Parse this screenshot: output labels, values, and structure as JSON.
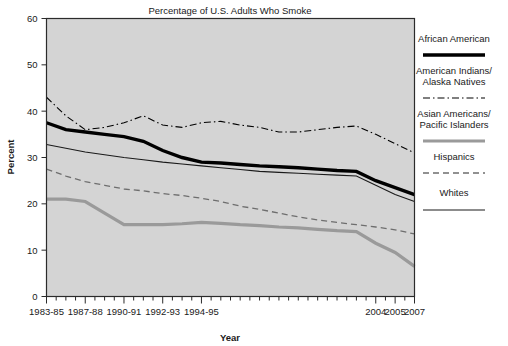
{
  "chart_data": {
    "type": "line",
    "title": "Percentage of U.S. Adults Who Smoke",
    "xlabel": "Year",
    "ylabel": "Percent",
    "ylim": [
      0,
      60
    ],
    "yticks": [
      0,
      10,
      20,
      30,
      40,
      50,
      60
    ],
    "ytick_labels": [
      "0",
      "10",
      "20",
      "30",
      "40",
      "50",
      "60"
    ],
    "grid": false,
    "legend_position": "right",
    "plot_background": "#d4d4d4",
    "x": [
      "1983-85",
      "1986",
      "1987-88",
      "1989",
      "1990-91",
      "1991",
      "1992-93",
      "1993",
      "1994-95",
      "1996",
      "1997",
      "1998",
      "1999",
      "2000",
      "2001",
      "2002",
      "2003",
      "2004",
      "2005",
      "2007"
    ],
    "xtick_labels": [
      "1983-85",
      "1987-88",
      "1990-91",
      "1992-93",
      "1994-95",
      "2004",
      "2005",
      "2007"
    ],
    "xtick_label_positions": [
      0,
      2,
      4,
      6,
      8,
      17,
      18,
      19
    ],
    "series": [
      {
        "name": "African American",
        "color": "#000000",
        "style": "solid",
        "width": 3.4,
        "values": [
          37.5,
          36.0,
          35.5,
          35.0,
          34.5,
          33.5,
          31.5,
          30.0,
          29.0,
          28.8,
          28.5,
          28.2,
          28.0,
          27.8,
          27.5,
          27.2,
          27.0,
          25.0,
          23.5,
          22.0
        ]
      },
      {
        "name": "American Indians/Alaska Natives",
        "color": "#000000",
        "style": "dashdot",
        "width": 1.1,
        "values": [
          43.0,
          39.0,
          36.0,
          36.5,
          37.5,
          39.0,
          37.0,
          36.5,
          37.5,
          37.8,
          37.0,
          36.5,
          35.5,
          35.5,
          36.0,
          36.5,
          36.8,
          35.0,
          33.0,
          31.0
        ]
      },
      {
        "name": "Asian Americans/Pacific Islanders",
        "color": "#9a9a9a",
        "style": "solid",
        "width": 3.2,
        "values": [
          21.0,
          21.0,
          20.5,
          18.0,
          15.5,
          15.5,
          15.5,
          15.7,
          16.0,
          15.8,
          15.5,
          15.3,
          15.0,
          14.8,
          14.5,
          14.2,
          14.0,
          11.5,
          9.5,
          6.5
        ]
      },
      {
        "name": "Hispanics",
        "color": "#6e6e6e",
        "style": "dashed",
        "width": 1.3,
        "values": [
          27.5,
          26.0,
          24.8,
          24.0,
          23.2,
          22.8,
          22.2,
          21.8,
          21.2,
          20.5,
          19.5,
          18.8,
          18.0,
          17.2,
          16.5,
          16.0,
          15.5,
          15.0,
          14.4,
          13.5
        ]
      },
      {
        "name": "Whites",
        "color": "#1a1a1a",
        "style": "solid",
        "width": 1.1,
        "values": [
          32.8,
          32.0,
          31.2,
          30.6,
          30.0,
          29.5,
          29.0,
          28.6,
          28.2,
          27.8,
          27.4,
          27.0,
          26.8,
          26.6,
          26.4,
          26.2,
          26.0,
          24.0,
          22.0,
          20.5
        ]
      }
    ]
  },
  "legend": {
    "entries": [
      {
        "label_line1": "African American",
        "label_line2": ""
      },
      {
        "label_line1": "American Indians/",
        "label_line2": "Alaska Natives"
      },
      {
        "label_line1": "Asian Americans/",
        "label_line2": "Pacific Islanders"
      },
      {
        "label_line1": "Hispanics",
        "label_line2": ""
      },
      {
        "label_line1": "Whites",
        "label_line2": ""
      }
    ]
  }
}
